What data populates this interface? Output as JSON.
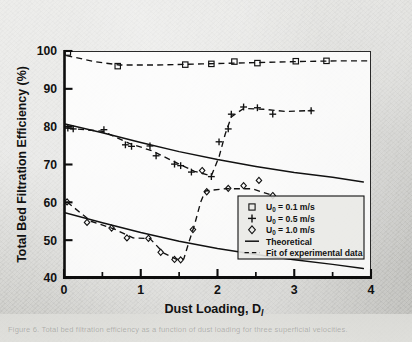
{
  "figure": {
    "background_color": "#d2d2ce",
    "ink_color": "#111111",
    "bottom_caption_ghost": "Figure 6.  Total bed filtration efficiency as a function of dust loading for three superficial velocities."
  },
  "chart_data": {
    "type": "line",
    "title": "",
    "xlabel": "Dust Loading, D",
    "xlabel_subscript": "l",
    "ylabel": "Total Bed Filtration Efficiency (%)",
    "xlim": [
      0,
      4
    ],
    "ylim": [
      40,
      100
    ],
    "xticks": [
      0,
      1,
      2,
      3,
      4
    ],
    "xtick_labels": [
      "0",
      "1",
      "2",
      "3",
      "4"
    ],
    "xminor_ticks": [
      0.5,
      1.5,
      2.5,
      3.5
    ],
    "yticks": [
      40,
      50,
      60,
      70,
      80,
      90,
      100
    ],
    "ytick_labels": [
      "40",
      "50",
      "60",
      "70",
      "80",
      "90",
      "100"
    ],
    "grid": false,
    "legend_position": "lower right",
    "series": [
      {
        "name": "U0 = 0.1 m/s",
        "marker": "square",
        "style": "markers",
        "points": [
          {
            "x": 0.05,
            "y": 99.6
          },
          {
            "x": 0.7,
            "y": 96.0
          },
          {
            "x": 1.58,
            "y": 96.4
          },
          {
            "x": 1.92,
            "y": 96.6
          },
          {
            "x": 2.22,
            "y": 97.2
          },
          {
            "x": 2.52,
            "y": 96.8
          },
          {
            "x": 3.02,
            "y": 97.3
          },
          {
            "x": 3.42,
            "y": 97.4
          }
        ]
      },
      {
        "name": "U0 = 0.5 m/s",
        "marker": "plus",
        "style": "markers",
        "points": [
          {
            "x": 0.05,
            "y": 79.6
          },
          {
            "x": 0.12,
            "y": 79.4
          },
          {
            "x": 0.52,
            "y": 79.2
          },
          {
            "x": 0.8,
            "y": 75.2
          },
          {
            "x": 0.88,
            "y": 74.8
          },
          {
            "x": 1.12,
            "y": 74.9
          },
          {
            "x": 1.2,
            "y": 72.3
          },
          {
            "x": 1.44,
            "y": 70.1
          },
          {
            "x": 1.52,
            "y": 69.7
          },
          {
            "x": 1.66,
            "y": 68.0
          },
          {
            "x": 1.92,
            "y": 66.8
          },
          {
            "x": 2.02,
            "y": 76.0
          },
          {
            "x": 2.14,
            "y": 79.4
          },
          {
            "x": 2.18,
            "y": 83.3
          },
          {
            "x": 2.34,
            "y": 85.2
          },
          {
            "x": 2.52,
            "y": 85.0
          },
          {
            "x": 2.72,
            "y": 83.3
          },
          {
            "x": 3.22,
            "y": 84.2
          }
        ]
      },
      {
        "name": "U0 = 1.0 m/s",
        "marker": "diamond",
        "style": "markers",
        "points": [
          {
            "x": 0.04,
            "y": 60.1
          },
          {
            "x": 0.3,
            "y": 54.7
          },
          {
            "x": 0.62,
            "y": 53.2
          },
          {
            "x": 0.82,
            "y": 50.6
          },
          {
            "x": 1.1,
            "y": 50.5
          },
          {
            "x": 1.26,
            "y": 46.8
          },
          {
            "x": 1.44,
            "y": 44.9
          },
          {
            "x": 1.52,
            "y": 44.8
          },
          {
            "x": 1.68,
            "y": 52.8
          },
          {
            "x": 1.86,
            "y": 62.8
          },
          {
            "x": 1.8,
            "y": 68.4
          },
          {
            "x": 2.14,
            "y": 63.7
          },
          {
            "x": 2.34,
            "y": 64.4
          },
          {
            "x": 2.54,
            "y": 65.8
          },
          {
            "x": 2.72,
            "y": 61.8
          }
        ]
      }
    ],
    "theoretical_curves": [
      {
        "name": "Theoretical (U0 = 0.5 m/s)",
        "style": "solid",
        "points": [
          {
            "x": 0.0,
            "y": 80.8
          },
          {
            "x": 0.5,
            "y": 78.4
          },
          {
            "x": 1.0,
            "y": 75.8
          },
          {
            "x": 1.5,
            "y": 73.4
          },
          {
            "x": 2.0,
            "y": 71.3
          },
          {
            "x": 2.5,
            "y": 69.5
          },
          {
            "x": 3.0,
            "y": 67.9
          },
          {
            "x": 3.5,
            "y": 66.6
          },
          {
            "x": 3.9,
            "y": 65.4
          }
        ]
      },
      {
        "name": "Theoretical (U0 = 1.0 m/s)",
        "style": "solid",
        "points": [
          {
            "x": 0.0,
            "y": 57.3
          },
          {
            "x": 0.5,
            "y": 54.6
          },
          {
            "x": 1.0,
            "y": 52.0
          },
          {
            "x": 1.5,
            "y": 49.7
          },
          {
            "x": 2.0,
            "y": 47.8
          },
          {
            "x": 2.5,
            "y": 46.2
          },
          {
            "x": 3.0,
            "y": 44.8
          },
          {
            "x": 3.5,
            "y": 43.6
          },
          {
            "x": 3.9,
            "y": 42.5
          }
        ]
      }
    ],
    "fit_curves": [
      {
        "name": "Fit of experimental data (U0 = 0.1 m/s)",
        "style": "dashed",
        "points": [
          {
            "x": 0.03,
            "y": 98.8
          },
          {
            "x": 0.4,
            "y": 97.2
          },
          {
            "x": 0.72,
            "y": 96.3
          },
          {
            "x": 1.2,
            "y": 96.3
          },
          {
            "x": 1.8,
            "y": 96.6
          },
          {
            "x": 2.4,
            "y": 96.9
          },
          {
            "x": 3.0,
            "y": 97.2
          },
          {
            "x": 3.6,
            "y": 97.4
          },
          {
            "x": 3.95,
            "y": 97.4
          }
        ]
      },
      {
        "name": "Fit of experimental data (U0 = 0.5 m/s)",
        "style": "dashed",
        "points": [
          {
            "x": 0.05,
            "y": 79.6
          },
          {
            "x": 0.5,
            "y": 78.8
          },
          {
            "x": 0.85,
            "y": 75.6
          },
          {
            "x": 1.15,
            "y": 73.6
          },
          {
            "x": 1.45,
            "y": 70.6
          },
          {
            "x": 1.7,
            "y": 68.2
          },
          {
            "x": 1.92,
            "y": 67.0
          },
          {
            "x": 2.02,
            "y": 72.0
          },
          {
            "x": 2.1,
            "y": 78.0
          },
          {
            "x": 2.18,
            "y": 82.6
          },
          {
            "x": 2.34,
            "y": 84.8
          },
          {
            "x": 2.6,
            "y": 84.6
          },
          {
            "x": 2.9,
            "y": 84.0
          },
          {
            "x": 3.24,
            "y": 84.3
          }
        ]
      },
      {
        "name": "Fit of experimental data (U0 = 1.0 m/s)",
        "style": "dashed",
        "points": [
          {
            "x": 0.04,
            "y": 60.1
          },
          {
            "x": 0.35,
            "y": 55.0
          },
          {
            "x": 0.65,
            "y": 53.0
          },
          {
            "x": 0.9,
            "y": 50.6
          },
          {
            "x": 1.12,
            "y": 50.4
          },
          {
            "x": 1.3,
            "y": 46.6
          },
          {
            "x": 1.46,
            "y": 45.0
          },
          {
            "x": 1.56,
            "y": 45.0
          },
          {
            "x": 1.62,
            "y": 49.0
          },
          {
            "x": 1.7,
            "y": 54.0
          },
          {
            "x": 1.78,
            "y": 60.0
          },
          {
            "x": 1.84,
            "y": 63.0
          },
          {
            "x": 2.1,
            "y": 63.6
          },
          {
            "x": 2.45,
            "y": 63.6
          },
          {
            "x": 2.72,
            "y": 61.8
          }
        ]
      }
    ],
    "legend": {
      "entries": [
        {
          "label": "U0 = 0.1 m/s",
          "symbol": "square",
          "prefix": "U",
          "sub": "0",
          "rest": " =  0.1 m/s"
        },
        {
          "label": "U0 = 0.5 m/s",
          "symbol": "plus",
          "prefix": "U",
          "sub": "0",
          "rest": " =  0.5 m/s"
        },
        {
          "label": "U0 = 1.0 m/s",
          "symbol": "diamond",
          "prefix": "U",
          "sub": "0",
          "rest": " =  1.0 m/s"
        },
        {
          "label": "Theoretical",
          "symbol": "solid-line"
        },
        {
          "label": "Fit of experimental data",
          "symbol": "dashed-line"
        }
      ]
    }
  }
}
